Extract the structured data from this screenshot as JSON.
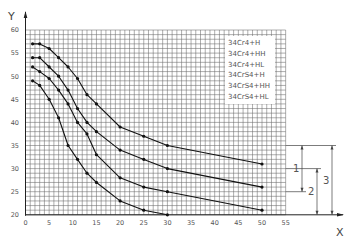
{
  "chart_data": {
    "type": "line",
    "title": "",
    "xlabel": "X",
    "ylabel": "Y",
    "xlim": [
      0,
      55
    ],
    "ylim": [
      20,
      60
    ],
    "x_ticks": [
      0,
      5,
      10,
      15,
      20,
      25,
      30,
      35,
      40,
      45,
      50,
      55
    ],
    "y_ticks": [
      20,
      25,
      30,
      35,
      40,
      45,
      50,
      55,
      60
    ],
    "grid": true,
    "grid_step_x": 1,
    "grid_step_y": 1,
    "legend": {
      "position": "upper right (inset)",
      "entries": [
        "34Cr4+H",
        "34Cr4+HH",
        "34Cr4+HL",
        "34CrS4+H",
        "34CrS4+HH",
        "34CrS4+HL"
      ]
    },
    "series": [
      {
        "name": "curve-1",
        "points": [
          [
            1.5,
            57
          ],
          [
            3,
            57
          ],
          [
            5,
            56
          ],
          [
            7,
            54
          ],
          [
            9,
            52
          ],
          [
            11,
            49.5
          ],
          [
            13,
            46
          ],
          [
            15,
            44
          ],
          [
            20,
            39
          ],
          [
            25,
            37
          ],
          [
            30,
            35
          ],
          [
            50,
            31
          ]
        ]
      },
      {
        "name": "curve-2",
        "points": [
          [
            1.5,
            54
          ],
          [
            3,
            54
          ],
          [
            5,
            52
          ],
          [
            7,
            50
          ],
          [
            9,
            47
          ],
          [
            11,
            43
          ],
          [
            13,
            40
          ],
          [
            15,
            38
          ],
          [
            20,
            34
          ],
          [
            25,
            32
          ],
          [
            30,
            30
          ],
          [
            50,
            26
          ]
        ]
      },
      {
        "name": "curve-3",
        "points": [
          [
            1.5,
            52
          ],
          [
            3,
            51
          ],
          [
            5,
            49.5
          ],
          [
            7,
            47
          ],
          [
            9,
            44
          ],
          [
            11,
            40
          ],
          [
            13,
            37.5
          ],
          [
            15,
            33
          ],
          [
            20,
            28
          ],
          [
            25,
            26
          ],
          [
            30,
            25
          ],
          [
            50,
            21
          ]
        ]
      },
      {
        "name": "curve-4",
        "points": [
          [
            1.5,
            49
          ],
          [
            3,
            48
          ],
          [
            5,
            45
          ],
          [
            7,
            41
          ],
          [
            9,
            35
          ],
          [
            11,
            32
          ],
          [
            13,
            29
          ],
          [
            15,
            27
          ],
          [
            20,
            23
          ],
          [
            25,
            21
          ],
          [
            30,
            20
          ]
        ]
      }
    ],
    "annotations": [
      {
        "label": "1",
        "from_y": 35,
        "to_y": 25
      },
      {
        "label": "2",
        "from_y": 30,
        "to_y": 20
      },
      {
        "label": "3",
        "from_y": 35,
        "to_y": 20
      }
    ]
  }
}
